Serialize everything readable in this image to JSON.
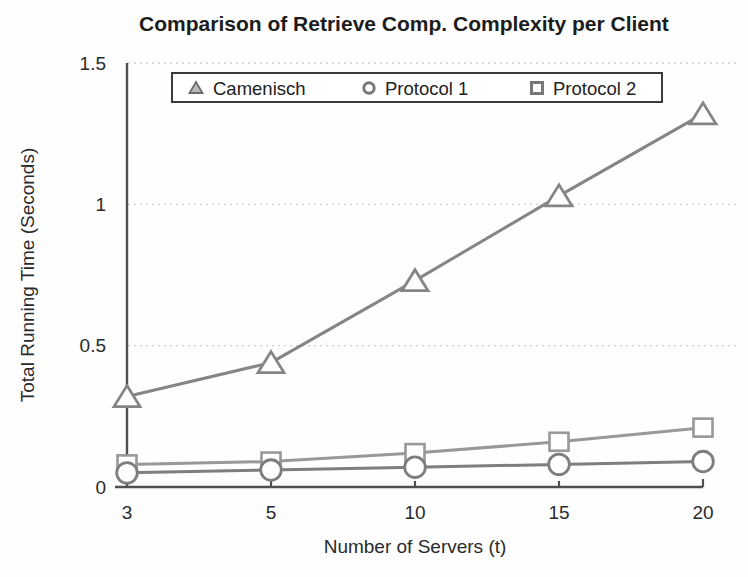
{
  "title": "Comparison of Retrieve Comp. Complexity per Client",
  "chart_data": {
    "type": "line",
    "title": "Comparison of Retrieve Comp. Complexity per Client",
    "xlabel": "Number of Servers (t)",
    "ylabel": "Total Running Time (Seconds)",
    "x": [
      3,
      5,
      10,
      15,
      20
    ],
    "x_tick_labels": [
      "3",
      "5",
      "10",
      "15",
      "20"
    ],
    "x_spacing": "categorical-equal",
    "ylim": [
      0,
      1.5
    ],
    "yticks": [
      0,
      0.5,
      1,
      1.5
    ],
    "ytick_labels": [
      "0",
      "0.5",
      "1",
      "1.5"
    ],
    "grid": "horizontal-dashed",
    "legend_position": "top-inside-horizontal",
    "series": [
      {
        "name": "Camenisch",
        "marker": "triangle",
        "color": "#858585",
        "values": [
          0.32,
          0.44,
          0.73,
          1.03,
          1.32
        ]
      },
      {
        "name": "Protocol 1",
        "marker": "circle",
        "color": "#7e7e7e",
        "values": [
          0.05,
          0.06,
          0.07,
          0.08,
          0.09
        ]
      },
      {
        "name": "Protocol 2",
        "marker": "square",
        "color": "#989898",
        "values": [
          0.08,
          0.09,
          0.12,
          0.16,
          0.21
        ]
      }
    ],
    "marker_fill": "#ffffff",
    "axis_color": "#4f4f4f",
    "grid_color": "#cfcfcf",
    "text_color": "#262626",
    "legend_border_color": "#3a3a3a",
    "background_color": "#fefefe"
  }
}
